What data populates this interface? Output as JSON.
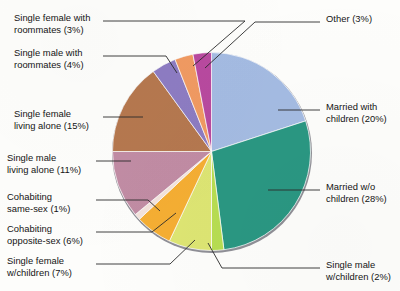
{
  "chart_data": {
    "type": "pie",
    "title": "",
    "subtitle": "",
    "xlabel": "",
    "ylabel": "",
    "legend_position": "callout-labels",
    "grid": false,
    "units": "percent",
    "start_angle_deg": -90,
    "direction": "clockwise",
    "categories": [
      "Married with children",
      "Married w/o children",
      "Single male w/children",
      "Single female w/children",
      "Cohabiting opposite-sex",
      "Cohabiting same-sex",
      "Single male living alone",
      "Single female living alone",
      "Single male with roommates",
      "Single female with roommates",
      "Other"
    ],
    "values": [
      20,
      28,
      2,
      7,
      6,
      1,
      11,
      15,
      4,
      3,
      3
    ],
    "colors": [
      "#a4bbe2",
      "#2a9782",
      "#b7dd52",
      "#d9e86e",
      "#f5b233",
      "#f0ddd2",
      "#c08aa2",
      "#b5784f",
      "#8f7fc4",
      "#f29a63",
      "#b martial"
    ],
    "slices": [
      {
        "label": "Married with children",
        "value": 20,
        "value_text": "20%",
        "color": "#a4bbe2",
        "callout": "Married with\nchildren (20%)"
      },
      {
        "label": "Married w/o children",
        "value": 28,
        "value_text": "28%",
        "color": "#2a9782",
        "callout": "Married w/o\nchildren (28%)"
      },
      {
        "label": "Single male w/children",
        "value": 2,
        "value_text": "2%",
        "color": "#b7dd52",
        "callout": "Single male\nw/children (2%)"
      },
      {
        "label": "Single female w/children",
        "value": 7,
        "value_text": "7%",
        "color": "#dde573",
        "callout": "Single female\nw/children (7%)"
      },
      {
        "label": "Cohabiting opposite-sex",
        "value": 6,
        "value_text": "6%",
        "color": "#f5ae33",
        "callout": "Cohabiting\nopposite-sex (6%)"
      },
      {
        "label": "Cohabiting same-sex",
        "value": 1,
        "value_text": "1%",
        "color": "#f3e3dc",
        "callout": "Cohabiting\nsame-sex (1%)"
      },
      {
        "label": "Single male living alone",
        "value": 11,
        "value_text": "11%",
        "color": "#c18ca4",
        "callout": "Single male\nliving alone (11%)"
      },
      {
        "label": "Single female living alone",
        "value": 15,
        "value_text": "15%",
        "color": "#b5784f",
        "callout": "Single female\nliving alone (15%)"
      },
      {
        "label": "Single male with roommates",
        "value": 4,
        "value_text": "4%",
        "color": "#8d7cc2",
        "callout": "Single male with\nroommates (4%)"
      },
      {
        "label": "Single female with roommates",
        "value": 3,
        "value_text": "3%",
        "color": "#f09a62",
        "callout": "Single female with\nroommates (3%)"
      },
      {
        "label": "Other",
        "value": 3,
        "value_text": "3%",
        "color": "#b8499f",
        "callout": "Other (3%)"
      }
    ]
  },
  "callouts": {
    "single_female_roommates": "Single female with\nroommates (3%)",
    "single_male_roommates": "Single male with\nroommates (4%)",
    "single_female_alone": "Single female\nliving alone (15%)",
    "single_male_alone": "Single male\nliving alone (11%)",
    "cohabiting_same_sex": "Cohabiting\nsame-sex (1%)",
    "cohabiting_opposite_sex": "Cohabiting\nopposite-sex (6%)",
    "single_female_children": "Single female\nw/children (7%)",
    "single_male_children": "Single male\nw/children (2%)",
    "married_wo_children": "Married w/o\nchildren (28%)",
    "married_with_children": "Married with\nchildren (20%)",
    "other": "Other (3%)"
  },
  "style": {
    "background": "#fdfdfb",
    "leader_line_color": "#2a2a2a",
    "pie_edge_color": "#8d8d93",
    "text_color": "#141414"
  }
}
